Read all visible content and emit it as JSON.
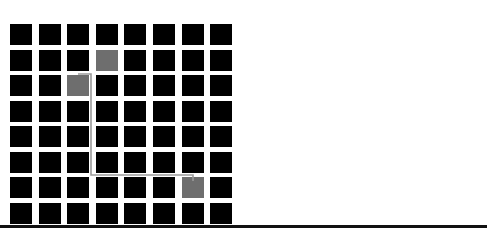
{
  "grid": {
    "rows": 8,
    "cols": 8,
    "origin_x": 10,
    "origin_y": 24,
    "pitch_x": 28.6,
    "pitch_y": 25.5,
    "cell_color": "#000000",
    "highlight_color": "#6e6e6e",
    "highlighted_cells": [
      {
        "row": 1,
        "col": 3
      },
      {
        "row": 2,
        "col": 2
      },
      {
        "row": 6,
        "col": 6
      }
    ]
  },
  "path": {
    "color": "#9a9a9a",
    "points": [
      [
        78,
        74
      ],
      [
        91,
        74
      ],
      [
        91,
        175
      ],
      [
        193,
        175
      ],
      [
        193,
        181
      ]
    ]
  },
  "baseline": {
    "color": "#111111"
  }
}
